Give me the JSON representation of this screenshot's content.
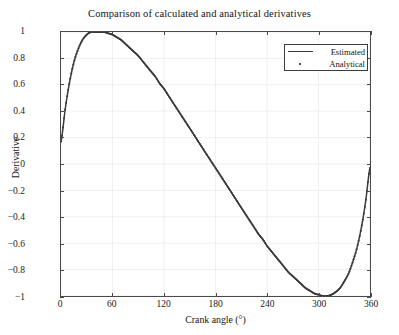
{
  "figure": {
    "title": "Comparison of calculated and analytical derivatives",
    "background": "#ffffff",
    "frame_color": "#4a4a4a",
    "grid_color": "#ececec"
  },
  "axes": {
    "xlabel": "Crank angle (°)",
    "ylabel": "Derivative",
    "xticks": [
      "0",
      "60",
      "120",
      "180",
      "240",
      "300",
      "360"
    ],
    "yticks": [
      "1",
      "0.8",
      "0.6",
      "0.4",
      "0.2",
      "0",
      "−0.2",
      "−0.4",
      "−0.6",
      "−0.8",
      "−1"
    ]
  },
  "legend": {
    "position": "top-right",
    "entries": [
      {
        "label": "Estimated",
        "style": "line",
        "color": "#3a3a3a"
      },
      {
        "label": "Analytical",
        "style": "dot",
        "color": "#1a1a1a"
      }
    ]
  },
  "chart_data": {
    "type": "line",
    "title": "Comparison of calculated and analytical derivatives",
    "xlabel": "Crank angle (°)",
    "ylabel": "Derivative",
    "xlim": [
      0,
      360
    ],
    "ylim": [
      -1,
      1
    ],
    "xticks": [
      0,
      60,
      120,
      180,
      240,
      300,
      360
    ],
    "yticks": [
      -1,
      -0.8,
      -0.6,
      -0.4,
      -0.2,
      0,
      0.2,
      0.4,
      0.6,
      0.8,
      1
    ],
    "grid": true,
    "legend_position": "upper right",
    "annotations": [],
    "series": [
      {
        "name": "Estimated",
        "style": "line",
        "color": "#3a3a3a",
        "x": [
          0,
          5,
          10,
          15,
          20,
          25,
          30,
          35,
          40,
          45,
          50,
          55,
          60,
          65,
          70,
          75,
          80,
          85,
          90,
          95,
          100,
          105,
          110,
          115,
          120,
          125,
          130,
          135,
          140,
          145,
          150,
          155,
          160,
          165,
          170,
          175,
          180,
          185,
          190,
          195,
          200,
          205,
          210,
          215,
          220,
          225,
          230,
          235,
          240,
          245,
          250,
          255,
          260,
          265,
          270,
          275,
          280,
          285,
          290,
          295,
          300,
          305,
          310,
          315,
          320,
          325,
          330,
          335,
          340,
          345,
          350,
          355,
          360
        ],
        "y": [
          0.17,
          0.42,
          0.62,
          0.77,
          0.87,
          0.94,
          0.98,
          1.0,
          1.0,
          1.0,
          1.0,
          0.99,
          0.98,
          0.96,
          0.94,
          0.91,
          0.88,
          0.85,
          0.82,
          0.78,
          0.74,
          0.7,
          0.66,
          0.61,
          0.57,
          0.52,
          0.47,
          0.42,
          0.37,
          0.32,
          0.27,
          0.22,
          0.17,
          0.12,
          0.07,
          0.02,
          -0.03,
          -0.08,
          -0.13,
          -0.18,
          -0.23,
          -0.28,
          -0.33,
          -0.38,
          -0.43,
          -0.48,
          -0.53,
          -0.57,
          -0.62,
          -0.66,
          -0.7,
          -0.74,
          -0.78,
          -0.82,
          -0.85,
          -0.88,
          -0.91,
          -0.94,
          -0.96,
          -0.98,
          -0.99,
          -1.0,
          -1.0,
          -0.99,
          -0.97,
          -0.94,
          -0.89,
          -0.83,
          -0.74,
          -0.63,
          -0.48,
          -0.28,
          -0.03
        ]
      },
      {
        "name": "Analytical",
        "style": "dot",
        "color": "#1a1a1a",
        "x": [
          0,
          5,
          10,
          15,
          20,
          25,
          30,
          35,
          40,
          45,
          50,
          55,
          60,
          65,
          70,
          75,
          80,
          85,
          90,
          95,
          100,
          105,
          110,
          115,
          120,
          125,
          130,
          135,
          140,
          145,
          150,
          155,
          160,
          165,
          170,
          175,
          180,
          185,
          190,
          195,
          200,
          205,
          210,
          215,
          220,
          225,
          230,
          235,
          240,
          245,
          250,
          255,
          260,
          265,
          270,
          275,
          280,
          285,
          290,
          295,
          300,
          305,
          310,
          315,
          320,
          325,
          330,
          335,
          340,
          345,
          350,
          355,
          360
        ],
        "y": [
          0.17,
          0.42,
          0.62,
          0.77,
          0.87,
          0.94,
          0.98,
          1.0,
          1.0,
          1.0,
          1.0,
          0.99,
          0.98,
          0.96,
          0.94,
          0.91,
          0.88,
          0.85,
          0.82,
          0.78,
          0.74,
          0.7,
          0.66,
          0.61,
          0.57,
          0.52,
          0.47,
          0.42,
          0.37,
          0.32,
          0.27,
          0.22,
          0.17,
          0.12,
          0.07,
          0.02,
          -0.03,
          -0.08,
          -0.13,
          -0.18,
          -0.23,
          -0.28,
          -0.33,
          -0.38,
          -0.43,
          -0.48,
          -0.53,
          -0.57,
          -0.62,
          -0.66,
          -0.7,
          -0.74,
          -0.78,
          -0.82,
          -0.85,
          -0.88,
          -0.91,
          -0.94,
          -0.96,
          -0.98,
          -0.99,
          -1.0,
          -1.0,
          -0.99,
          -0.97,
          -0.94,
          -0.89,
          -0.83,
          -0.74,
          -0.63,
          -0.48,
          -0.28,
          -0.03
        ]
      }
    ]
  }
}
